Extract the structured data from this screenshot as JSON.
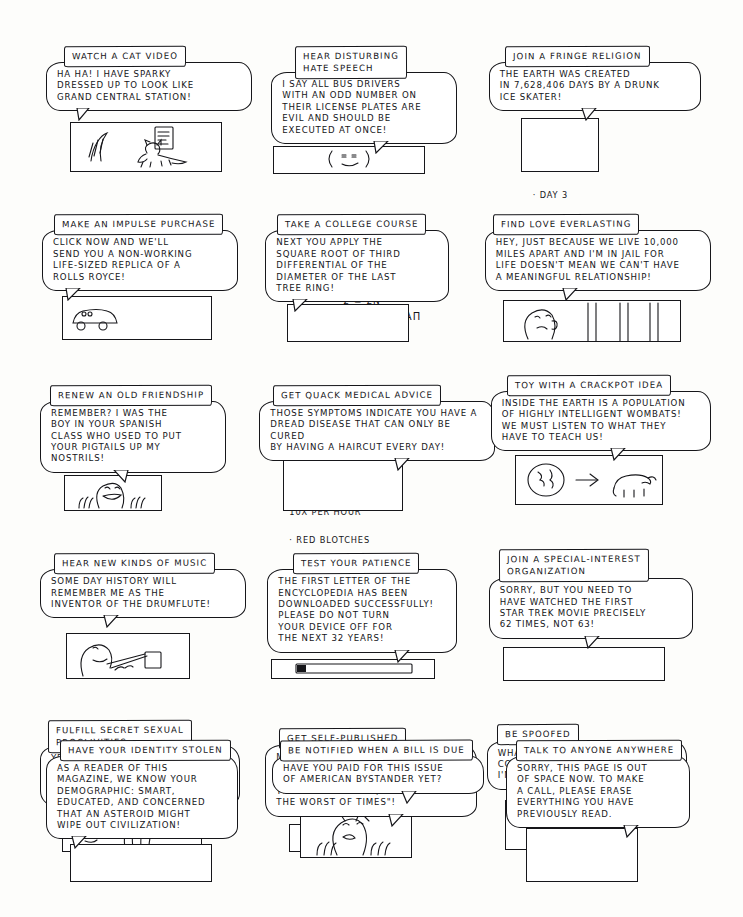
{
  "page": {
    "background_color": "#fdfdfb",
    "ink_color": "#141418",
    "columns": 3,
    "rows": 5,
    "panel_count": 15
  },
  "panels": [
    {
      "id": "watch-a-cat-video",
      "title": "WATCH A CAT VIDEO",
      "speech": "HA HA! I HAVE SPARKY\nDRESSED UP TO LOOK LIKE\nGRAND CENTRAL STATION!",
      "art": "cat-in-costume",
      "extras": []
    },
    {
      "id": "hear-disturbing-hate-speech",
      "title": "HEAR DISTURBING\nHATE SPEECH",
      "speech": "I SAY ALL BUS DRIVERS\nWITH AN ODD NUMBER ON\nTHEIR LICENSE PLATES ARE\nEVIL AND SHOULD BE\nEXECUTED AT ONCE!",
      "art": "angry-face-small",
      "extras": []
    },
    {
      "id": "join-a-fringe-religion",
      "title": "JOIN A FRINGE RELIGION",
      "speech": "THE EARTH WAS CREATED\nIN 7,628,406 DAYS BY A DRUNK\nICE SKATER!",
      "art": "day-list",
      "extras": [
        "· DAY 1",
        "· DAY 2",
        "· DAY 3"
      ]
    },
    {
      "id": "make-an-impulse-purchase",
      "title": "MAKE AN IMPULSE PURCHASE",
      "speech": "CLICK NOW AND WE'LL\nSEND YOU A NON-WORKING\nLIFE-SIZED REPLICA OF A\nROLLS ROYCE!",
      "art": "car-and-buy-button",
      "extras": [
        "BUY",
        "ACT\nNOW!"
      ]
    },
    {
      "id": "take-a-college-course",
      "title": "TAKE A COLLEGE COURSE",
      "speech": "NEXT YOU APPLY THE\nSQUARE ROOT OF THIRD\nDIFFERENTIAL OF THE\nDIAMETER OF THE LAST\nTREE RING!",
      "art": "equation-scrawl",
      "extras": [
        "2 = Σn",
        "∫ᵃᵇ ∂y/∂x (x²+1) Bαπ"
      ]
    },
    {
      "id": "find-love-everlasting",
      "title": "FIND LOVE EVERLASTING",
      "speech": "HEY, JUST BECAUSE WE LIVE 10,000\nMILES APART AND I'M IN JAIL FOR\nLIFE DOESN'T MEAN WE CAN'T HAVE\nA MEANINGFUL RELATIONSHIP!",
      "art": "face-behind-bars",
      "extras": []
    },
    {
      "id": "renew-an-old-friendship",
      "title": "RENEW AN OLD FRIENDSHIP",
      "speech": "REMEMBER? I WAS THE\nBOY IN YOUR SPANISH\nCLASS WHO USED TO PUT\nYOUR PIGTAILS UP MY\nNOSTRILS!",
      "art": "grinning-face-hands",
      "extras": []
    },
    {
      "id": "get-quack-medical-advice",
      "title": "GET QUACK MEDICAL ADVICE",
      "speech": "THOSE SYMPTOMS INDICATE YOU HAVE A\nDREAD DISEASE THAT CAN ONLY BE CURED\nBY HAVING A HAIRCUT EVERY DAY!",
      "art": "symptom-list",
      "extras": [
        "· COUGHING",
        "  10x PER HOUR",
        "· RED BLOTCHES"
      ]
    },
    {
      "id": "toy-with-a-crackpot-idea",
      "title": "TOY WITH A CRACKPOT IDEA",
      "speech": "INSIDE THE EARTH IS A POPULATION\nOF HIGHLY INTELLIGENT WOMBATS!\nWE MUST LISTEN TO WHAT THEY\nHAVE TO TEACH US!",
      "art": "earth-arrow-wombat",
      "extras": []
    },
    {
      "id": "hear-new-kinds-of-music",
      "title": "HEAR NEW KINDS OF MUSIC",
      "speech": "SOME DAY HISTORY WILL\nREMEMBER ME AS THE\nINVENTOR OF THE DRUMFLUTE!",
      "art": "musician-with-drumflute",
      "extras": []
    },
    {
      "id": "test-your-patience",
      "title": "TEST YOUR PATIENCE",
      "speech": "THE FIRST LETTER OF THE\nENCYCLOPEDIA HAS BEEN\nDOWNLOADED SUCCESSFULLY!\nPLEASE DO NOT TURN\nYOUR DEVICE OFF FOR\nTHE NEXT 32 YEARS!",
      "art": "progress-bar",
      "extras": []
    },
    {
      "id": "join-a-special-interest-organization",
      "title": "JOIN A SPECIAL-INTEREST\nORGANIZATION",
      "speech": "SORRY, BUT YOU NEED TO\nHAVE WATCHED THE FIRST\nSTAR TREK MOVIE PRECISELY\n62 TIMES, NOT 63!",
      "art": "declined-button",
      "extras": [
        "DECLINED",
        "!"
      ]
    },
    {
      "id": "fulfill-secret-sexual-proclivities",
      "title": "FULFILL SECRET SEXUAL\nPROCLIVITIES",
      "speech": "YES, YOU CAN STARE AT THE\nSECOND FINGER OF MY RIGHT\nHAND FOR AS LONG AS YOU\nWANT!",
      "art": "hand-and-face",
      "extras": []
    },
    {
      "id": "get-self-published",
      "title": "GET SELF-PUBLISHED",
      "speech": "MY NOVEL BEGINS \"IT WAS THE\nWORST OF TIMES, IT WAS THE\nBEST OF TIMES\", NOT \"IT WAS\nTHE BEST OF TIMES, IT WAS\nTHE WORST OF TIMES\"!",
      "art": "read-button",
      "extras": [
        "READ"
      ]
    },
    {
      "id": "be-spoofed",
      "title": "BE SPOOFED",
      "speech": "WHAT DO YOU MEAN, THIS\nCOULDN'T BE MY PICTURE IF\nI'M 97 YEARS OLD?",
      "art": "smiling-woman-portrait",
      "extras": []
    },
    {
      "id": "have-your-identity-stolen",
      "title": "HAVE YOUR IDENTITY STOLEN",
      "speech": "AS A READER OF THIS\nMAGAZINE, WE KNOW YOUR\nDEMOGRAPHIC: SMART,\nEDUCATED, AND CONCERNED\nTHAT AN ASTEROID MIGHT\nWIPE OUT CIVILIZATION!",
      "art": "you-arrow-us",
      "extras": [
        "YOU → US"
      ]
    },
    {
      "id": "be-notified-when-a-bill-is-due",
      "title": "BE NOTIFIED WHEN A BILL IS DUE",
      "speech": "HAVE YOU PAID FOR THIS ISSUE\nOF AMERICAN BYSTANDER YET?",
      "art": "worried-face",
      "extras": []
    },
    {
      "id": "talk-to-anyone-anywhere",
      "title": "TALK TO ANYONE ANYWHERE",
      "speech": "SORRY, THIS PAGE IS OUT\nOF SPACE NOW. TO MAKE\nA CALL, PLEASE ERASE\nEVERYTHING YOU HAVE\nPREVIOUSLY READ.",
      "art": "x-circle",
      "extras": [
        "X"
      ]
    }
  ]
}
